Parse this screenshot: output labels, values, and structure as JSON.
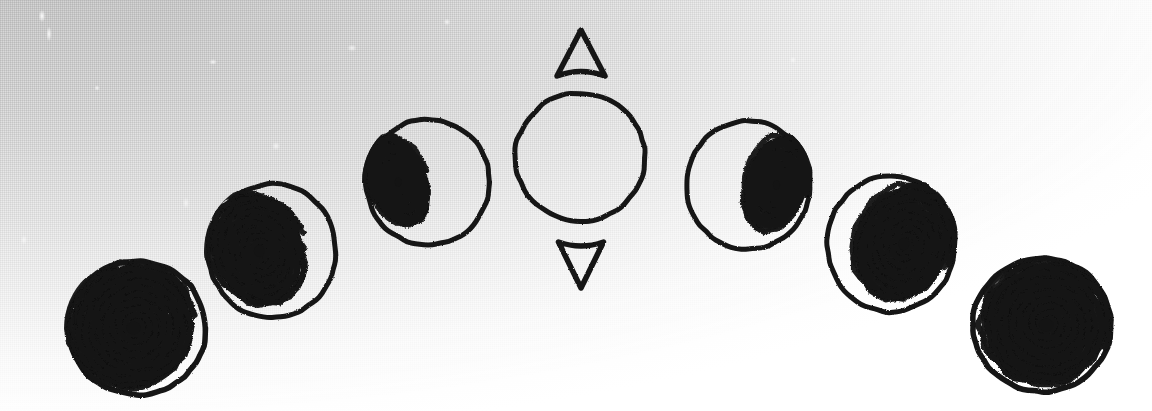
{
  "figure": {
    "medium": "scanned pen drawing",
    "background": {
      "paper_light": "#ffffff",
      "paper_shadow": "#cfcfcf",
      "texture": "halftone-scan-grain",
      "gradient_direction": "top-left-grey to bottom-right-white"
    },
    "ink_color": "#141414",
    "canvas": {
      "width": 1152,
      "height": 411
    }
  },
  "elements": {
    "center_circle": {
      "name": "open circle",
      "cx": 580,
      "cy": 157,
      "rx": 65,
      "ry": 64,
      "fill_state": "empty",
      "shaded_fraction": 0.0,
      "stroke_width": 6
    },
    "arrow_up": {
      "name": "up arrow",
      "glyph": "triangle-up-hollow",
      "cx": 581,
      "cy": 53,
      "width": 48,
      "height": 46,
      "direction": "up"
    },
    "arrow_down": {
      "name": "down arrow",
      "glyph": "triangle-down-hollow",
      "cx": 581,
      "cy": 265,
      "width": 45,
      "height": 46,
      "direction": "down"
    },
    "spiral_circles": [
      {
        "index": 1,
        "position": "far-left",
        "cx": 137,
        "cy": 328,
        "rx": 69,
        "ry": 67,
        "shaded_fraction": 1.0,
        "shade_side": "full",
        "spiral_turns": 9,
        "spiral_center_offset_x": -0.05,
        "spiral_rx": 0.96,
        "spiral_ry": 0.96,
        "spiral_rotation": -18
      },
      {
        "index": 2,
        "position": "left-mid",
        "cx": 272,
        "cy": 251,
        "rx": 64,
        "ry": 67,
        "shaded_fraction": 0.8,
        "shade_side": "left",
        "spiral_turns": 9,
        "spiral_center_offset_x": -0.2,
        "spiral_rx": 0.76,
        "spiral_ry": 0.9,
        "spiral_rotation": -28
      },
      {
        "index": 3,
        "position": "left-inner",
        "cx": 428,
        "cy": 182,
        "rx": 62,
        "ry": 63,
        "shaded_fraction": 0.45,
        "shade_side": "left",
        "spiral_turns": 9,
        "spiral_center_offset_x": -0.48,
        "spiral_rx": 0.5,
        "spiral_ry": 0.78,
        "spiral_rotation": -20
      },
      {
        "index": 4,
        "position": "center",
        "cx": 580,
        "cy": 157,
        "rx": 65,
        "ry": 64,
        "shaded_fraction": 0.0,
        "shade_side": "none",
        "spiral_turns": 0,
        "spiral_center_offset_x": 0,
        "spiral_rx": 0,
        "spiral_ry": 0,
        "spiral_rotation": 0
      },
      {
        "index": 5,
        "position": "right-inner",
        "cx": 748,
        "cy": 185,
        "rx": 62,
        "ry": 64,
        "shaded_fraction": 0.45,
        "shade_side": "right",
        "spiral_turns": 9,
        "spiral_center_offset_x": 0.46,
        "spiral_rx": 0.52,
        "spiral_ry": 0.8,
        "spiral_rotation": 20
      },
      {
        "index": 6,
        "position": "right-mid",
        "cx": 891,
        "cy": 244,
        "rx": 64,
        "ry": 68,
        "shaded_fraction": 0.8,
        "shade_side": "right",
        "spiral_turns": 9,
        "spiral_center_offset_x": 0.2,
        "spiral_rx": 0.78,
        "spiral_ry": 0.92,
        "spiral_rotation": 26
      },
      {
        "index": 7,
        "position": "far-right",
        "cx": 1042,
        "cy": 325,
        "rx": 69,
        "ry": 67,
        "shaded_fraction": 1.0,
        "shade_side": "full",
        "spiral_turns": 9,
        "spiral_center_offset_x": 0.06,
        "spiral_rx": 0.96,
        "spiral_ry": 0.96,
        "spiral_rotation": 16
      }
    ]
  }
}
